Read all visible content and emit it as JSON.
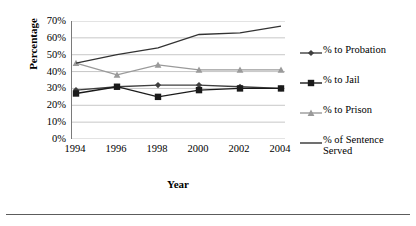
{
  "chart_data": {
    "type": "line",
    "title": "",
    "xlabel": "Year",
    "ylabel": "Percentage",
    "categories": [
      "1994",
      "1996",
      "1998",
      "2000",
      "2002",
      "2004"
    ],
    "x": [
      1994,
      1996,
      1998,
      2000,
      2002,
      2004
    ],
    "ylim": [
      0,
      70
    ],
    "ytick_labels": [
      "70%",
      "60%",
      "50%",
      "40%",
      "30%",
      "20%",
      "10%",
      "0%"
    ],
    "ytick_values": [
      70,
      60,
      50,
      40,
      30,
      20,
      10,
      0
    ],
    "grid": "horizontal",
    "legend_position": "right",
    "series": [
      {
        "name": "% to Probation",
        "marker": "diamond",
        "color": "#3f3f3f",
        "values": [
          29,
          31,
          32,
          32,
          31,
          30
        ]
      },
      {
        "name": "% to Jail",
        "marker": "square",
        "color": "#1a1a1a",
        "values": [
          27,
          31,
          25,
          29,
          30,
          30
        ]
      },
      {
        "name": "% to Prison",
        "marker": "triangle",
        "color": "#9a9a9a",
        "values": [
          45,
          38,
          44,
          41,
          41,
          41
        ]
      },
      {
        "name": "% of Sentence Served",
        "marker": "none",
        "color": "#333333",
        "values": [
          45,
          50,
          54,
          62,
          63,
          67
        ]
      }
    ]
  },
  "legend": {
    "items": [
      {
        "label": "% to Probation"
      },
      {
        "label": "% to Jail"
      },
      {
        "label": "% to Prison"
      },
      {
        "label": "% of Sentence\nServed"
      }
    ]
  }
}
